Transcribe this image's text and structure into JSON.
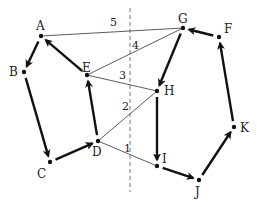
{
  "diagram": {
    "type": "directed-graph",
    "nodes": [
      {
        "id": "A",
        "label": "A",
        "x": 41,
        "y": 36,
        "lx": 36,
        "ly": 30
      },
      {
        "id": "B",
        "label": "B",
        "x": 24,
        "y": 72,
        "lx": 9,
        "ly": 76
      },
      {
        "id": "C",
        "label": "C",
        "x": 50,
        "y": 162,
        "lx": 37,
        "ly": 178
      },
      {
        "id": "D",
        "label": "D",
        "x": 98,
        "y": 141,
        "lx": 92,
        "ly": 156
      },
      {
        "id": "E",
        "label": "E",
        "x": 87,
        "y": 75,
        "lx": 82,
        "ly": 72
      },
      {
        "id": "F",
        "label": "F",
        "x": 219,
        "y": 37,
        "lx": 224,
        "ly": 33
      },
      {
        "id": "G",
        "label": "G",
        "x": 183,
        "y": 28,
        "lx": 178,
        "ly": 23
      },
      {
        "id": "H",
        "label": "H",
        "x": 157,
        "y": 91,
        "lx": 164,
        "ly": 95
      },
      {
        "id": "I",
        "label": "I",
        "x": 157,
        "y": 166,
        "lx": 162,
        "ly": 163
      },
      {
        "id": "J",
        "label": "J",
        "x": 199,
        "y": 180,
        "lx": 195,
        "ly": 196
      },
      {
        "id": "K",
        "label": "K",
        "x": 234,
        "y": 127,
        "lx": 240,
        "ly": 132
      }
    ],
    "directed_edges": [
      {
        "from": "A",
        "to": "B"
      },
      {
        "from": "B",
        "to": "C"
      },
      {
        "from": "C",
        "to": "D"
      },
      {
        "from": "D",
        "to": "E"
      },
      {
        "from": "E",
        "to": "A"
      },
      {
        "from": "G",
        "to": "H"
      },
      {
        "from": "H",
        "to": "I"
      },
      {
        "from": "I",
        "to": "J"
      },
      {
        "from": "J",
        "to": "K"
      },
      {
        "from": "K",
        "to": "F"
      },
      {
        "from": "F",
        "to": "G"
      }
    ],
    "cut_edges": [
      {
        "from": "A",
        "to": "G",
        "label": "5",
        "lx": 110,
        "ly": 26
      },
      {
        "from": "E",
        "to": "G",
        "label": "4",
        "lx": 132,
        "ly": 49
      },
      {
        "from": "E",
        "to": "H",
        "label": "3",
        "lx": 119,
        "ly": 79
      },
      {
        "from": "D",
        "to": "H",
        "label": "2",
        "lx": 122,
        "ly": 110
      },
      {
        "from": "D",
        "to": "I",
        "label": "1",
        "lx": 124,
        "ly": 152
      }
    ],
    "cut_line": {
      "x": 130,
      "y1": 8,
      "y2": 192
    }
  }
}
